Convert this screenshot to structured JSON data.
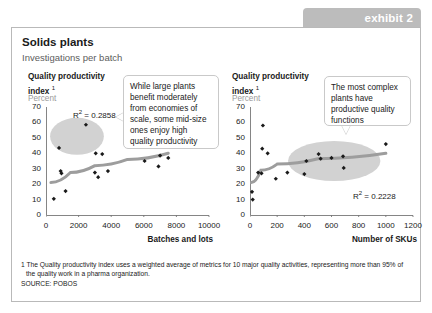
{
  "exhibit": {
    "tab_label": "exhibit 2"
  },
  "header": {
    "title": "Solids plants",
    "subtitle": "Investigations per batch"
  },
  "footnote": {
    "line1": "1 The Quality productivity index uses a weighted average of metrics for 10 major quality activities, representing more than 95% of",
    "line2": "the quality work in a pharma organization.",
    "source": "SOURCE: POBOS"
  },
  "colors": {
    "tab_gray": "#bcbcbc",
    "ellipse_gray": "#d2d2d2",
    "trend_gray": "#9d9d9d",
    "marker_black": "#1a1a1a",
    "border_gray": "#b9b9b9",
    "units_gray": "#9a9a9a"
  },
  "callouts": {
    "left": "While large plants benefit moderately from economies of scale, some mid-size ones enjoy high quality productivity",
    "right": "The most complex plants have productive quality functions"
  },
  "chart_data": [
    {
      "id": "batches-and-lots",
      "type": "scatter",
      "title": "Quality productivity index ¹",
      "units": "Percent",
      "xlabel": "Batches and lots",
      "ylabel": "",
      "xlim": [
        0,
        10000
      ],
      "ylim": [
        0,
        70
      ],
      "xticks": [
        0,
        2000,
        4000,
        6000,
        8000,
        10000
      ],
      "yticks": [
        0,
        10,
        20,
        30,
        40,
        50,
        60,
        70
      ],
      "grid": false,
      "annotation": "R² = 0.2858",
      "r2": 0.2858,
      "points": [
        {
          "x": 480,
          "y": 10.5
        },
        {
          "x": 800,
          "y": 43.5
        },
        {
          "x": 900,
          "y": 28.5
        },
        {
          "x": 950,
          "y": 27.0
        },
        {
          "x": 1200,
          "y": 15.5
        },
        {
          "x": 2450,
          "y": 58.5
        },
        {
          "x": 3000,
          "y": 27.5
        },
        {
          "x": 3050,
          "y": 40.0
        },
        {
          "x": 3200,
          "y": 24.5
        },
        {
          "x": 3450,
          "y": 39.5
        },
        {
          "x": 3800,
          "y": 28.5
        },
        {
          "x": 6050,
          "y": 35.0
        },
        {
          "x": 6850,
          "y": 47.0
        },
        {
          "x": 6900,
          "y": 31.5
        },
        {
          "x": 7000,
          "y": 38.5
        },
        {
          "x": 7500,
          "y": 37.0
        }
      ],
      "trend": [
        {
          "x": 300,
          "y": 21.0
        },
        {
          "x": 1500,
          "y": 27.5
        },
        {
          "x": 3000,
          "y": 32.0
        },
        {
          "x": 5000,
          "y": 36.0
        },
        {
          "x": 7500,
          "y": 40.0
        }
      ],
      "highlight_ellipse": {
        "cx": 1900,
        "cy": 51,
        "rx": 1650,
        "ry": 12
      }
    },
    {
      "id": "number-of-skus",
      "type": "scatter",
      "title": "Quality productivity index ¹",
      "units": "Percent",
      "xlabel": "Number of SKUs",
      "ylabel": "",
      "xlim": [
        0,
        1200
      ],
      "ylim": [
        0,
        70
      ],
      "xticks": [
        0,
        200,
        400,
        600,
        800,
        1000,
        1200
      ],
      "yticks": [
        0,
        10,
        20,
        30,
        40,
        50,
        60,
        70
      ],
      "grid": false,
      "annotation": "R² = 0.2228",
      "r2": 0.2228,
      "points": [
        {
          "x": 15,
          "y": 15.0
        },
        {
          "x": 20,
          "y": 10.0
        },
        {
          "x": 60,
          "y": 27.5
        },
        {
          "x": 85,
          "y": 27.0
        },
        {
          "x": 90,
          "y": 43.0
        },
        {
          "x": 95,
          "y": 58.0
        },
        {
          "x": 130,
          "y": 40.0
        },
        {
          "x": 190,
          "y": 23.5
        },
        {
          "x": 275,
          "y": 27.5
        },
        {
          "x": 400,
          "y": 26.5
        },
        {
          "x": 415,
          "y": 35.0
        },
        {
          "x": 505,
          "y": 39.5
        },
        {
          "x": 520,
          "y": 36.5
        },
        {
          "x": 600,
          "y": 37.0
        },
        {
          "x": 685,
          "y": 38.0
        },
        {
          "x": 690,
          "y": 30.5
        },
        {
          "x": 1000,
          "y": 46.0
        }
      ],
      "trend": [
        {
          "x": 10,
          "y": 21.0
        },
        {
          "x": 80,
          "y": 29.0
        },
        {
          "x": 200,
          "y": 33.0
        },
        {
          "x": 500,
          "y": 36.5
        },
        {
          "x": 1000,
          "y": 40.0
        }
      ],
      "highlight_ellipse": {
        "cx": 620,
        "cy": 35,
        "rx": 340,
        "ry": 13
      }
    }
  ]
}
